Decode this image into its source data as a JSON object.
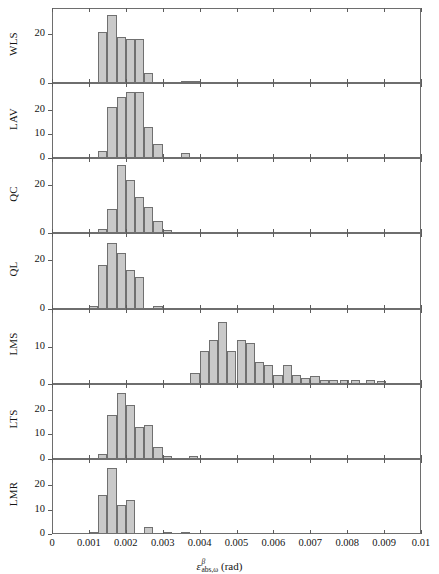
{
  "figure": {
    "x_axis_title_symbol": "ε",
    "x_axis_title_superscript": "β",
    "x_axis_title_subscript": "abs,ω",
    "x_axis_title_units": "(rad)",
    "bar_fill_color": "#c9c9c9",
    "bar_edge_color": "#707070",
    "axis_color": "#6e6e6e"
  },
  "chart_data": {
    "type": "bar",
    "title": "",
    "xlabel": "εᴬᵇˢ,ω (rad)",
    "ylabel": "",
    "xlim": [
      0,
      0.01
    ],
    "grid": false,
    "legend": "none",
    "note": "Seven stacked histogram panels of absolute angular error; common x axis 0 to 0.01 rad; bin width 0.00025 rad.",
    "x_ticks": [
      "0",
      "0.001",
      "0.002",
      "0.003",
      "0.004",
      "0.005",
      "0.006",
      "0.007",
      "0.008",
      "0.009",
      "0.01"
    ],
    "x_tick_values": [
      0,
      0.001,
      0.002,
      0.003,
      0.004,
      0.005,
      0.006,
      0.007,
      0.008,
      0.009,
      0.01
    ],
    "bin_width": 0.00025,
    "panels": [
      {
        "name": "WLS",
        "ylim": [
          0,
          30
        ],
        "y_ticks": [
          0,
          20
        ],
        "y_tick_labels": [
          "0",
          "20"
        ],
        "bin_starts": [
          0.00125,
          0.0015,
          0.00175,
          0.002,
          0.00225,
          0.0025,
          0.0035,
          0.00375
        ],
        "values": [
          21,
          28,
          19,
          18,
          18,
          4,
          0.5,
          0.7
        ]
      },
      {
        "name": "LAV",
        "ylim": [
          0,
          30
        ],
        "y_ticks": [
          0,
          10,
          20
        ],
        "y_tick_labels": [
          "0",
          "10",
          "20"
        ],
        "bin_starts": [
          0.00125,
          0.0015,
          0.00175,
          0.002,
          0.00225,
          0.0025,
          0.00275,
          0.0035
        ],
        "values": [
          3,
          21,
          25,
          27,
          27,
          13,
          6,
          2
        ]
      },
      {
        "name": "QC",
        "ylim": [
          0,
          30
        ],
        "y_ticks": [
          0,
          20
        ],
        "y_tick_labels": [
          "0",
          "20"
        ],
        "bin_starts": [
          0.00125,
          0.0015,
          0.00175,
          0.002,
          0.00225,
          0.0025,
          0.00275,
          0.003
        ],
        "values": [
          2,
          10,
          28,
          22,
          15,
          11,
          5,
          1.5
        ]
      },
      {
        "name": "QL",
        "ylim": [
          0,
          30
        ],
        "y_ticks": [
          0,
          20
        ],
        "y_tick_labels": [
          "0",
          "20"
        ],
        "bin_starts": [
          0.001,
          0.00125,
          0.0015,
          0.00175,
          0.002,
          0.00225,
          0.00275
        ],
        "values": [
          1,
          18,
          27,
          23,
          16,
          13,
          1
        ]
      },
      {
        "name": "LMS",
        "ylim": [
          0,
          20
        ],
        "y_ticks": [
          0,
          10
        ],
        "y_tick_labels": [
          "0",
          "10"
        ],
        "bin_starts": [
          0.00375,
          0.004,
          0.00425,
          0.0045,
          0.00475,
          0.005,
          0.00525,
          0.0055,
          0.00575,
          0.006,
          0.00625,
          0.0065,
          0.00675,
          0.007,
          0.00725,
          0.0075,
          0.0078,
          0.0081,
          0.0085,
          0.0088
        ],
        "values": [
          3,
          9,
          12,
          17,
          9,
          12,
          11,
          6,
          5,
          2.5,
          5,
          2.5,
          1.5,
          2,
          1,
          1,
          1,
          1,
          1,
          0.8
        ]
      },
      {
        "name": "LTS",
        "ylim": [
          0,
          30
        ],
        "y_ticks": [
          0,
          10,
          20
        ],
        "y_tick_labels": [
          "0",
          "10",
          "20"
        ],
        "bin_starts": [
          0.00125,
          0.0015,
          0.00175,
          0.002,
          0.00225,
          0.0025,
          0.00275,
          0.003,
          0.0037
        ],
        "values": [
          2,
          18,
          27,
          22,
          13,
          14,
          5,
          1,
          1
        ]
      },
      {
        "name": "LMR",
        "ylim": [
          0,
          30
        ],
        "y_ticks": [
          0,
          10,
          20
        ],
        "y_tick_labels": [
          "0",
          "10",
          "20"
        ],
        "bin_starts": [
          0.001,
          0.00125,
          0.0015,
          0.00175,
          0.002,
          0.0025,
          0.003,
          0.0035
        ],
        "values": [
          1,
          16,
          27,
          12,
          14,
          3,
          1,
          0.8
        ]
      }
    ]
  }
}
